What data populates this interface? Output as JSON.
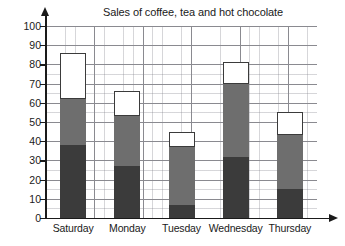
{
  "chart_data": {
    "type": "bar",
    "subtype": "stacked-bar",
    "title": "Sales of coffee, tea and hot chocolate",
    "xlabel": "",
    "ylabel": "",
    "categories": [
      "Saturday",
      "Monday",
      "Tuesday",
      "Wednesday",
      "Thursday"
    ],
    "series": [
      {
        "name": "coffee",
        "color": "#3b3b3b",
        "values": [
          38,
          27,
          7,
          32,
          15
        ]
      },
      {
        "name": "tea",
        "color": "#6e6e6e",
        "values": [
          24,
          26,
          30,
          38,
          28
        ]
      },
      {
        "name": "hot chocolate",
        "color": "#ffffff",
        "values": [
          24,
          13,
          8,
          11,
          12
        ]
      }
    ],
    "cumulative_tops": [
      [
        38,
        62,
        86
      ],
      [
        27,
        53,
        66
      ],
      [
        7,
        37,
        45
      ],
      [
        32,
        70,
        81
      ],
      [
        15,
        43,
        55
      ]
    ],
    "totals": [
      86,
      66,
      45,
      81,
      55
    ],
    "ylim": [
      0,
      100
    ],
    "ytick_step": 10,
    "yticks": [
      0,
      10,
      20,
      30,
      40,
      50,
      60,
      70,
      80,
      90,
      100
    ],
    "ytick_labels": [
      "0",
      "10",
      "20",
      "30",
      "40",
      "50",
      "60",
      "70",
      "80",
      "90",
      "100"
    ],
    "grid": true,
    "grid_minor_step": 2,
    "legend": false,
    "legend_position": "none"
  },
  "axes": {
    "y_arrow_icon": "up-arrow-icon",
    "x_arrow_icon": "right-arrow-icon"
  }
}
